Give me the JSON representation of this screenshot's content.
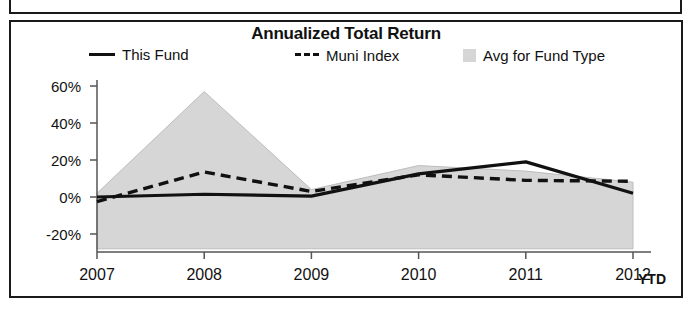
{
  "panel": {
    "title": "Annualized Total Return"
  },
  "legend": {
    "position": "top",
    "items": [
      {
        "label": "This Fund",
        "marker": "solid-line-swatch",
        "color": "#111111"
      },
      {
        "label": "Muni Index",
        "marker": "dashed-line-swatch",
        "color": "#111111"
      },
      {
        "label": "Avg for Fund Type",
        "marker": "area-swatch",
        "color": "#d6d6d6"
      }
    ]
  },
  "axes": {
    "y_ticks": [
      "-20%",
      "0%",
      "20%",
      "40%",
      "60%"
    ],
    "x_ticks": [
      "2007",
      "2008",
      "2009",
      "2010",
      "2011",
      "2012"
    ],
    "x_suffix_label": "YTD"
  },
  "chart_data": {
    "type": "line",
    "title": "Annualized Total Return",
    "xlabel": "",
    "ylabel": "",
    "x": [
      "2007",
      "2008",
      "2009",
      "2010",
      "2011",
      "2012"
    ],
    "categories": [
      "2007",
      "2008",
      "2009",
      "2010",
      "2011",
      "2012"
    ],
    "ylim": [
      -30,
      60
    ],
    "ytick_values": [
      -20,
      0,
      20,
      40,
      60
    ],
    "ytick_labels": [
      "-20%",
      "0%",
      "20%",
      "40%",
      "60%"
    ],
    "grid": false,
    "legend_position": "top",
    "series": [
      {
        "name": "This Fund",
        "style": "solid",
        "color": "#111111",
        "values": [
          0,
          1.5,
          0.5,
          12.5,
          19,
          2
        ]
      },
      {
        "name": "Muni Index",
        "style": "dashed",
        "color": "#111111",
        "values": [
          -2.5,
          13.5,
          3,
          12,
          9,
          8.5
        ]
      },
      {
        "name": "Avg for Fund Type",
        "style": "filled-band",
        "color": "#d6d6d6",
        "upper": [
          2,
          57,
          4,
          17,
          14,
          8
        ],
        "lower": [
          -28,
          -28,
          -28,
          -28,
          -28,
          -28
        ]
      }
    ]
  }
}
